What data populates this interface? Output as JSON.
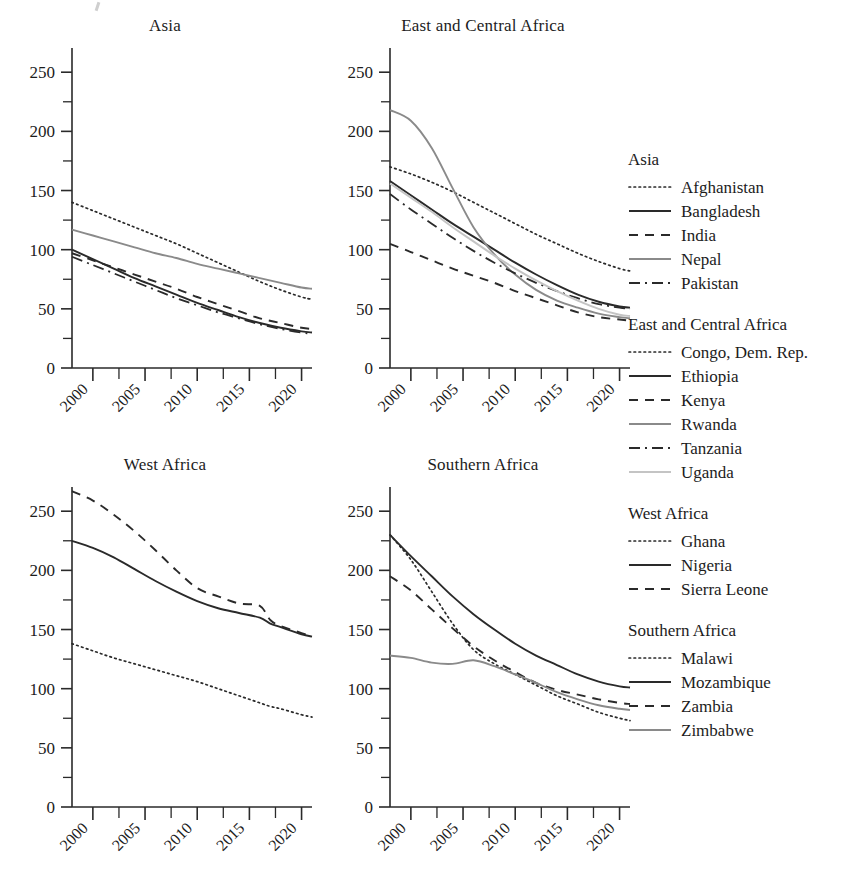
{
  "figure": {
    "stray_mark": "descender-fragment",
    "x_axis": {
      "min": 1998,
      "max": 2021,
      "major_ticks": [
        2000,
        2005,
        2010,
        2015,
        2020
      ],
      "major_tick_labels": [
        "2000",
        "2005",
        "2010",
        "2015",
        "2020"
      ],
      "minor_tick_step": 2.5,
      "label_rotation": -45
    },
    "y_axis": {
      "min": 0,
      "max": 262,
      "major_ticks": [
        0,
        50,
        100,
        150,
        200,
        250
      ],
      "major_tick_labels": [
        "0",
        "50",
        "100",
        "150",
        "200",
        "250"
      ],
      "minor_ticks": [
        25,
        75,
        125,
        175,
        225
      ],
      "grid": false
    },
    "colors": {
      "ink": "#2a2a2a",
      "grey_line": "#8a8a8a",
      "light_grey_line": "#c4c4c4",
      "background": "#ffffff"
    }
  },
  "legend": {
    "position": "right",
    "groups": [
      {
        "title": "Asia",
        "entries": [
          {
            "label": "Afghanistan",
            "style": "dotted",
            "color": "#2a2a2a"
          },
          {
            "label": "Bangladesh",
            "style": "solid",
            "color": "#2a2a2a"
          },
          {
            "label": "India",
            "style": "dashed",
            "color": "#2a2a2a"
          },
          {
            "label": "Nepal",
            "style": "solid",
            "color": "#8a8a8a"
          },
          {
            "label": "Pakistan",
            "style": "dashdot",
            "color": "#2a2a2a"
          }
        ]
      },
      {
        "title": "East and Central Africa",
        "entries": [
          {
            "label": "Congo, Dem. Rep.",
            "style": "dotted",
            "color": "#2a2a2a"
          },
          {
            "label": "Ethiopia",
            "style": "solid",
            "color": "#2a2a2a"
          },
          {
            "label": "Kenya",
            "style": "dashed",
            "color": "#2a2a2a"
          },
          {
            "label": "Rwanda",
            "style": "solid",
            "color": "#8a8a8a"
          },
          {
            "label": "Tanzania",
            "style": "dashdot",
            "color": "#2a2a2a"
          },
          {
            "label": "Uganda",
            "style": "solid",
            "color": "#c4c4c4"
          }
        ]
      },
      {
        "title": "West Africa",
        "entries": [
          {
            "label": "Ghana",
            "style": "dotted",
            "color": "#2a2a2a"
          },
          {
            "label": "Nigeria",
            "style": "solid",
            "color": "#2a2a2a"
          },
          {
            "label": "Sierra Leone",
            "style": "dashed",
            "color": "#2a2a2a"
          }
        ]
      },
      {
        "title": "Southern Africa",
        "entries": [
          {
            "label": "Malawi",
            "style": "dotted",
            "color": "#2a2a2a"
          },
          {
            "label": "Mozambique",
            "style": "solid",
            "color": "#2a2a2a"
          },
          {
            "label": "Zambia",
            "style": "dashed",
            "color": "#2a2a2a"
          },
          {
            "label": "Zimbabwe",
            "style": "solid",
            "color": "#8a8a8a"
          }
        ]
      }
    ]
  },
  "chart_data": [
    {
      "type": "line",
      "title": "Asia",
      "xlabel": "",
      "ylabel": "",
      "xlim": [
        1998,
        2021
      ],
      "ylim": [
        0,
        262
      ],
      "grid": false,
      "x": [
        1998,
        2000,
        2002,
        2004,
        2006,
        2008,
        2010,
        2012,
        2014,
        2016,
        2018,
        2020,
        2021
      ],
      "series": [
        {
          "name": "Afghanistan",
          "style": "dotted",
          "color": "#2a2a2a",
          "values": [
            140,
            133,
            126,
            119,
            112,
            105,
            97,
            89,
            81,
            73,
            66,
            60,
            58
          ]
        },
        {
          "name": "Bangladesh",
          "style": "solid",
          "color": "#2a2a2a",
          "values": [
            100,
            92,
            84,
            76,
            69,
            62,
            55,
            49,
            43,
            38,
            34,
            31,
            30
          ]
        },
        {
          "name": "India",
          "style": "dashed",
          "color": "#2a2a2a",
          "values": [
            97,
            91,
            85,
            79,
            73,
            67,
            60,
            54,
            48,
            42,
            38,
            34,
            33
          ]
        },
        {
          "name": "Nepal",
          "style": "solid",
          "color": "#8a8a8a",
          "values": [
            117,
            112,
            107,
            102,
            97,
            93,
            88,
            84,
            80,
            76,
            72,
            68,
            67
          ]
        },
        {
          "name": "Pakistan",
          "style": "dashdot",
          "color": "#2a2a2a",
          "values": [
            94,
            87,
            80,
            73,
            66,
            59,
            53,
            47,
            42,
            37,
            33,
            30,
            29
          ]
        }
      ]
    },
    {
      "type": "line",
      "title": "East and Central Africa",
      "xlabel": "",
      "ylabel": "",
      "xlim": [
        1998,
        2021
      ],
      "ylim": [
        0,
        262
      ],
      "grid": false,
      "x": [
        1998,
        2000,
        2002,
        2004,
        2006,
        2008,
        2010,
        2012,
        2014,
        2016,
        2018,
        2020,
        2021
      ],
      "series": [
        {
          "name": "Congo, Dem. Rep.",
          "style": "dotted",
          "color": "#2a2a2a",
          "values": [
            170,
            164,
            157,
            149,
            140,
            131,
            122,
            113,
            105,
            97,
            90,
            84,
            82
          ]
        },
        {
          "name": "Ethiopia",
          "style": "solid",
          "color": "#2a2a2a",
          "values": [
            158,
            146,
            134,
            122,
            111,
            100,
            89,
            79,
            70,
            62,
            56,
            52,
            51
          ]
        },
        {
          "name": "Kenya",
          "style": "dashed",
          "color": "#2a2a2a",
          "values": [
            105,
            98,
            91,
            84,
            78,
            72,
            65,
            59,
            53,
            47,
            43,
            41,
            40
          ]
        },
        {
          "name": "Rwanda",
          "style": "solid",
          "color": "#8a8a8a",
          "values": [
            218,
            209,
            186,
            152,
            119,
            96,
            79,
            66,
            57,
            51,
            46,
            43,
            42
          ]
        },
        {
          "name": "Tanzania",
          "style": "dashdot",
          "color": "#2a2a2a",
          "values": [
            147,
            134,
            122,
            110,
            99,
            89,
            80,
            72,
            65,
            59,
            54,
            51,
            50
          ]
        },
        {
          "name": "Uganda",
          "style": "solid",
          "color": "#c4c4c4",
          "values": [
            156,
            144,
            132,
            119,
            107,
            95,
            84,
            74,
            65,
            57,
            50,
            45,
            44
          ]
        }
      ]
    },
    {
      "type": "line",
      "title": "West Africa",
      "xlabel": "",
      "ylabel": "",
      "xlim": [
        1998,
        2021
      ],
      "ylim": [
        0,
        262
      ],
      "grid": false,
      "x": [
        1998,
        2000,
        2002,
        2004,
        2006,
        2008,
        2010,
        2012,
        2014,
        2016,
        2017,
        2018,
        2020,
        2021
      ],
      "series": [
        {
          "name": "Ghana",
          "style": "dotted",
          "color": "#2a2a2a",
          "values": [
            138,
            132,
            126,
            121,
            116,
            111,
            106,
            100,
            94,
            88,
            85,
            83,
            78,
            76
          ]
        },
        {
          "name": "Nigeria",
          "style": "solid",
          "color": "#2a2a2a",
          "values": [
            225,
            219,
            211,
            201,
            191,
            182,
            174,
            168,
            164,
            160,
            155,
            152,
            146,
            144
          ]
        },
        {
          "name": "Sierra Leone",
          "style": "dashed",
          "color": "#2a2a2a",
          "values": [
            267,
            259,
            247,
            233,
            217,
            200,
            185,
            178,
            172,
            170,
            158,
            153,
            147,
            144
          ]
        }
      ]
    },
    {
      "type": "line",
      "title": "Southern Africa",
      "xlabel": "",
      "ylabel": "",
      "xlim": [
        1998,
        2021
      ],
      "ylim": [
        0,
        262
      ],
      "grid": false,
      "x": [
        1998,
        2000,
        2002,
        2004,
        2006,
        2008,
        2010,
        2012,
        2014,
        2016,
        2018,
        2020,
        2021
      ],
      "series": [
        {
          "name": "Malawi",
          "style": "dotted",
          "color": "#2a2a2a",
          "values": [
            230,
            209,
            182,
            155,
            133,
            121,
            112,
            103,
            94,
            87,
            80,
            75,
            73
          ]
        },
        {
          "name": "Mozambique",
          "style": "solid",
          "color": "#2a2a2a",
          "values": [
            230,
            212,
            195,
            178,
            163,
            150,
            138,
            128,
            120,
            112,
            106,
            102,
            101
          ]
        },
        {
          "name": "Zambia",
          "style": "dashed",
          "color": "#2a2a2a",
          "values": [
            195,
            183,
            167,
            151,
            136,
            124,
            114,
            105,
            99,
            95,
            91,
            88,
            87
          ]
        },
        {
          "name": "Zimbabwe",
          "style": "solid",
          "color": "#8a8a8a",
          "values": [
            128,
            126,
            122,
            121,
            124,
            119,
            112,
            105,
            97,
            91,
            86,
            83,
            82
          ]
        }
      ]
    }
  ]
}
